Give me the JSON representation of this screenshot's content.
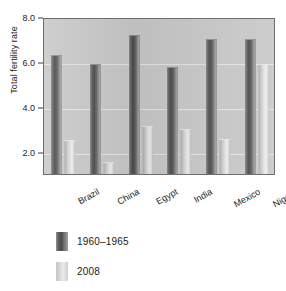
{
  "chart_data": {
    "type": "bar",
    "title": "",
    "xlabel": "",
    "ylabel": "Total fertility rate",
    "ylim": [
      1.0,
      8.0
    ],
    "yticks": [
      8.0,
      6.0,
      4.0,
      2.0
    ],
    "ytick_labels": [
      "8.0",
      "6.0",
      "4.0",
      "2.0"
    ],
    "grid": true,
    "legend_position": "below-left",
    "categories": [
      "Brazil",
      "China",
      "Egypt",
      "India",
      "Mexico",
      "Nigeria"
    ],
    "series": [
      {
        "name": "1960–1965",
        "color": "#4a4a4a",
        "values": [
          6.3,
          5.9,
          7.2,
          5.75,
          7.0,
          7.0
        ]
      },
      {
        "name": "2008",
        "color": "#dcdcdc",
        "values": [
          2.5,
          1.55,
          3.15,
          3.0,
          2.55,
          5.9
        ]
      }
    ]
  },
  "legend": {
    "items": [
      {
        "label": "1960–1965"
      },
      {
        "label": "2008"
      }
    ]
  }
}
